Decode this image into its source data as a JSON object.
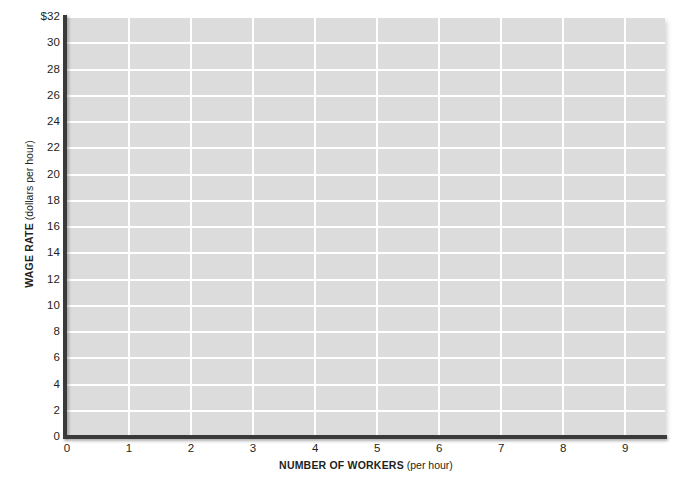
{
  "chart_data": {
    "type": "line",
    "title": "",
    "subtitle": "",
    "xlabel_bold": "NUMBER OF WORKERS",
    "xlabel_paren": "(per hour)",
    "ylabel_bold": "WAGE RATE",
    "ylabel_paren": "(dollars per hour)",
    "xlim": [
      0,
      9.64
    ],
    "ylim": [
      0,
      32
    ],
    "x_ticks": [
      0,
      1,
      2,
      3,
      4,
      5,
      6,
      7,
      8,
      9
    ],
    "x_tick_labels": [
      "0",
      "1",
      "2",
      "3",
      "4",
      "5",
      "6",
      "7",
      "8",
      "9"
    ],
    "y_ticks": [
      0,
      2,
      4,
      6,
      8,
      10,
      12,
      14,
      16,
      18,
      20,
      22,
      24,
      26,
      28,
      30,
      32
    ],
    "y_tick_labels": [
      "0",
      "2",
      "4",
      "6",
      "8",
      "10",
      "12",
      "14",
      "16",
      "18",
      "20",
      "22",
      "24",
      "26",
      "28",
      "30",
      "$32"
    ],
    "grid": true,
    "grid_color": "#ffffff",
    "plot_background": "#dcdcdc",
    "axis_color": "#3a3a3a",
    "page_background": "#ffffff",
    "legend": [],
    "series": [],
    "annotations": [],
    "note": "Blank grid worksheet — no data series are plotted."
  }
}
